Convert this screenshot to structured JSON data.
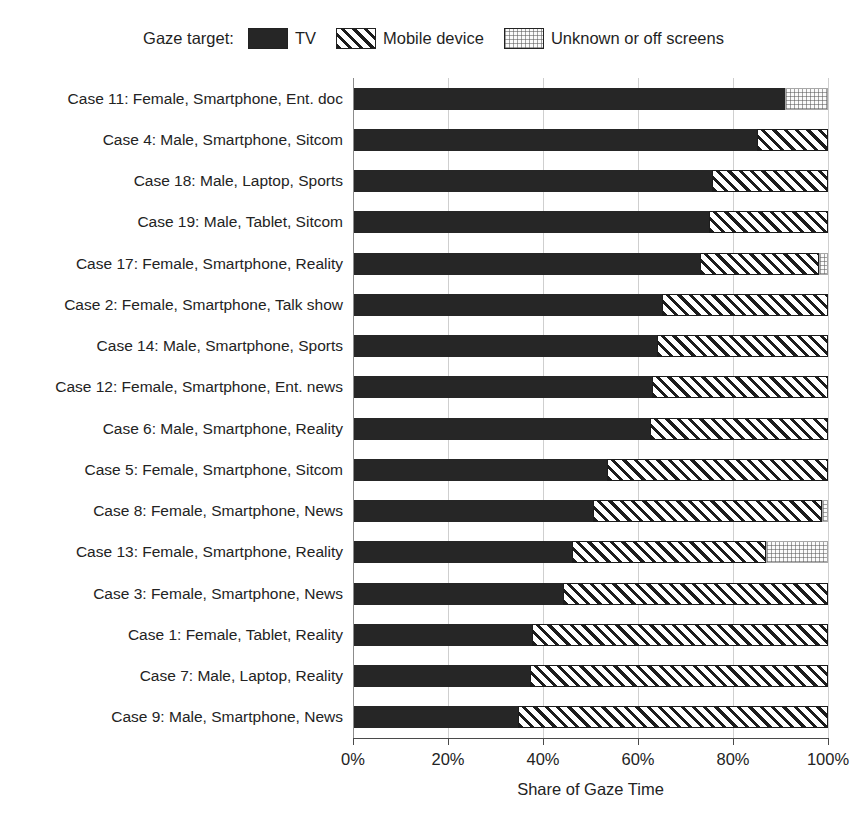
{
  "legend": {
    "title": "Gaze target:",
    "entries": [
      {
        "label": "TV",
        "key": "tv",
        "color": "#262626"
      },
      {
        "label": "Mobile device",
        "key": "mobile",
        "color": "#1c1c1c"
      },
      {
        "label": "Unknown or off screens",
        "key": "unknown",
        "color": "#e8e8e8"
      }
    ]
  },
  "axis": {
    "x_title": "Share of Gaze Time",
    "x_ticks": [
      "0%",
      "20%",
      "40%",
      "60%",
      "80%",
      "100%"
    ],
    "x_tick_values": [
      0,
      20,
      40,
      60,
      80,
      100
    ],
    "x_min": 0,
    "x_max": 100
  },
  "chart_data": {
    "type": "bar",
    "orientation": "horizontal",
    "stacked": true,
    "title": "",
    "subtitle": "",
    "xlabel": "Share of Gaze Time",
    "ylabel": "",
    "xlim": [
      0,
      100
    ],
    "grid": true,
    "legend_position": "top-center",
    "series": [
      {
        "name": "TV",
        "values": [
          91.0,
          85.0,
          75.5,
          75.0,
          73.0,
          65.0,
          64.0,
          63.0,
          62.5,
          53.5,
          50.5,
          46.0,
          44.3,
          37.7,
          37.3,
          34.8
        ]
      },
      {
        "name": "Mobile device",
        "values": [
          0.0,
          15.0,
          24.5,
          25.0,
          25.0,
          35.0,
          36.0,
          37.0,
          37.5,
          46.5,
          48.2,
          41.0,
          55.7,
          62.3,
          62.7,
          65.2
        ]
      },
      {
        "name": "Unknown or off screens",
        "values": [
          9.0,
          0.0,
          0.0,
          0.0,
          2.0,
          0.0,
          0.0,
          0.0,
          0.0,
          0.0,
          1.3,
          13.0,
          0.0,
          0.0,
          0.0,
          0.0
        ]
      }
    ],
    "categories": [
      "Case 11: Female, Smartphone, Ent. doc",
      "Case 4: Male, Smartphone, Sitcom",
      "Case 18: Male, Laptop, Sports",
      "Case 19: Male, Tablet, Sitcom",
      "Case 17: Female, Smartphone, Reality",
      "Case 2: Female, Smartphone, Talk show",
      "Case 14: Male, Smartphone, Sports",
      "Case 12: Female, Smartphone, Ent. news",
      "Case 6: Male, Smartphone, Reality",
      "Case 5: Female, Smartphone, Sitcom",
      "Case 8: Female, Smartphone, News",
      "Case 13: Female, Smartphone, Reality",
      "Case 3: Female, Smartphone, News",
      "Case 1: Female, Tablet, Reality",
      "Case 7: Male, Laptop, Reality",
      "Case 9: Male, Smartphone, News"
    ]
  }
}
